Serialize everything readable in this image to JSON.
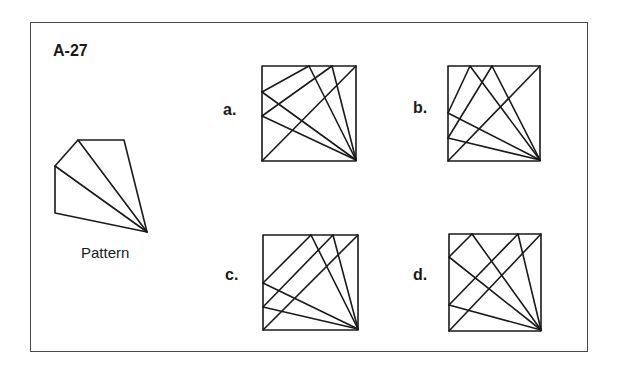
{
  "puzzle": {
    "id_label": "A-27",
    "pattern_caption": "Pattern",
    "options": [
      {
        "key": "a",
        "label": "a."
      },
      {
        "key": "b",
        "label": "b."
      },
      {
        "key": "c",
        "label": "c."
      },
      {
        "key": "d",
        "label": "d."
      }
    ]
  },
  "figures": {
    "pattern": {
      "polygon": [
        [
          78,
          140
        ],
        [
          124,
          140
        ],
        [
          147,
          232
        ],
        [
          55,
          213
        ],
        [
          55,
          166
        ]
      ],
      "lines": [
        [
          [
            147,
            232
          ],
          [
            78,
            140
          ]
        ],
        [
          [
            147,
            232
          ],
          [
            55,
            166
          ]
        ]
      ]
    },
    "a": {
      "box": [
        262,
        66,
        356,
        161
      ],
      "lines": [
        [
          [
            262,
            92
          ],
          [
            309,
            66
          ]
        ],
        [
          [
            262,
            92
          ],
          [
            356,
            160
          ]
        ],
        [
          [
            309,
            66
          ],
          [
            356,
            160
          ]
        ],
        [
          [
            332,
            66
          ],
          [
            356,
            160
          ]
        ],
        [
          [
            262,
            116
          ],
          [
            332,
            66
          ]
        ],
        [
          [
            262,
            116
          ],
          [
            356,
            160
          ]
        ],
        [
          [
            262,
            161
          ],
          [
            356,
            66
          ]
        ]
      ]
    },
    "b": {
      "box": [
        448,
        66,
        540,
        161
      ],
      "lines": [
        [
          [
            448,
            113
          ],
          [
            470,
            66
          ]
        ],
        [
          [
            470,
            66
          ],
          [
            540,
            160
          ]
        ],
        [
          [
            448,
            138
          ],
          [
            492,
            66
          ]
        ],
        [
          [
            492,
            66
          ],
          [
            540,
            160
          ]
        ],
        [
          [
            448,
            113
          ],
          [
            540,
            160
          ]
        ],
        [
          [
            448,
            138
          ],
          [
            540,
            160
          ]
        ],
        [
          [
            448,
            161
          ],
          [
            540,
            66
          ]
        ]
      ]
    },
    "c": {
      "box": [
        263,
        235,
        358,
        330
      ],
      "lines": [
        [
          [
            263,
            283
          ],
          [
            311,
            235
          ]
        ],
        [
          [
            311,
            235
          ],
          [
            358,
            329
          ]
        ],
        [
          [
            263,
            307
          ],
          [
            333,
            235
          ]
        ],
        [
          [
            333,
            235
          ],
          [
            358,
            329
          ]
        ],
        [
          [
            263,
            283
          ],
          [
            358,
            329
          ]
        ],
        [
          [
            263,
            307
          ],
          [
            358,
            329
          ]
        ],
        [
          [
            263,
            330
          ],
          [
            358,
            235
          ]
        ]
      ]
    },
    "d": {
      "box": [
        449,
        234,
        541,
        331
      ],
      "lines": [
        [
          [
            449,
            257
          ],
          [
            472,
            234
          ]
        ],
        [
          [
            472,
            234
          ],
          [
            541,
            330
          ]
        ],
        [
          [
            449,
            257
          ],
          [
            541,
            330
          ]
        ],
        [
          [
            449,
            305
          ],
          [
            518,
            234
          ]
        ],
        [
          [
            518,
            234
          ],
          [
            541,
            330
          ]
        ],
        [
          [
            449,
            305
          ],
          [
            541,
            330
          ]
        ],
        [
          [
            449,
            331
          ],
          [
            541,
            234
          ]
        ]
      ]
    }
  }
}
